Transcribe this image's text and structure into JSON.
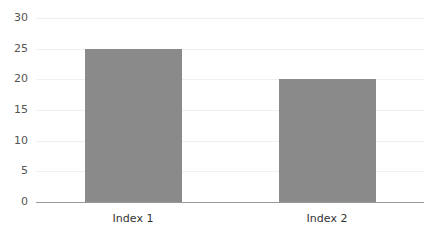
{
  "chart_data": {
    "type": "bar",
    "title": "",
    "xlabel": "",
    "ylabel": "",
    "categories": [
      "Index 1",
      "Index 2"
    ],
    "values": [
      25,
      20
    ],
    "ylim": [
      0,
      30
    ],
    "yticks": [
      "0",
      "5",
      "10",
      "15",
      "20",
      "25",
      "30"
    ],
    "grid": true,
    "legend": null,
    "bar_color": "#8a8a8a"
  }
}
